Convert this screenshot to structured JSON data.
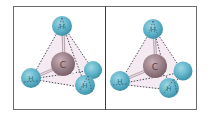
{
  "figure": {
    "colors": {
      "frame": "#6b6b6b",
      "hydrogen": "#5fb4c9",
      "hydrogen_edge": "#3f93a8",
      "carbon": "#9a8088",
      "carbon_edge": "#7a626a",
      "tetra_fill": "#f1e3ee",
      "dash": "#3a3a4a",
      "bond": "#b9a9b3"
    },
    "panels": [
      {
        "name": "left",
        "carbon_label": "C",
        "hydrogen_labels": [
          "H",
          "H",
          "H",
          "H"
        ]
      },
      {
        "name": "right",
        "carbon_label": "C",
        "hydrogen_labels": [
          "H",
          "H",
          "H",
          "H"
        ]
      }
    ]
  }
}
